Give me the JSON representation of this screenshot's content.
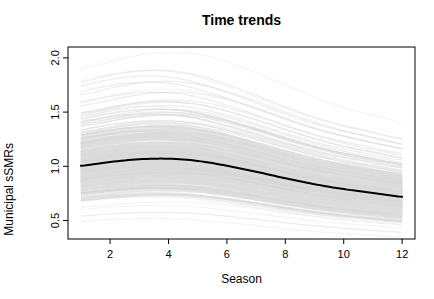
{
  "chart_data": {
    "type": "line",
    "title": "Time trends",
    "xlabel": "Season",
    "ylabel": "Municipal sSMRs",
    "x_tick_values": [
      2,
      4,
      6,
      8,
      10,
      12
    ],
    "x_tick_labels": [
      "2",
      "4",
      "6",
      "8",
      "10",
      "12"
    ],
    "y_tick_values": [
      0.5,
      1.0,
      1.5,
      2.0
    ],
    "y_tick_labels": [
      "0.5",
      "1.0",
      "1.5",
      "2.0"
    ],
    "xlim": [
      0.56,
      12.44
    ],
    "ylim": [
      0.33,
      2.1
    ],
    "grid": false,
    "legend": false,
    "seasons": [
      1,
      2,
      3,
      4,
      5,
      6,
      7,
      8,
      9,
      10,
      11,
      12
    ],
    "mean_series": {
      "name": "mean-trend",
      "color": "#000000",
      "line_width": 2,
      "values": [
        1.005,
        1.04,
        1.065,
        1.07,
        1.05,
        1.005,
        0.95,
        0.89,
        0.835,
        0.79,
        0.755,
        0.72
      ]
    },
    "spaghetti": {
      "name": "municipal-curves",
      "description": "Many light-gray municipal sSMR seasonal curves spread multiplicatively around the mean trend; dense band roughly 0.85-1.42 at the season 3-4 peak, extreme curves reaching about 2.09 high and 0.48 low",
      "n_curves": 420,
      "scale_sigma": 0.17,
      "outlier_scales": [
        1.92,
        1.78,
        1.66,
        1.58,
        1.5,
        1.44,
        0.52,
        0.48
      ],
      "phase_jitter": 0.9,
      "value_jitter": 0.015,
      "seed": 7,
      "color": "#dcdcdc",
      "alpha": 0.55,
      "accent_color": "#c6c6c6",
      "accent_alpha": 0.2,
      "line_width": 1.2,
      "band_peak_range": [
        0.85,
        1.42
      ],
      "band_extent_range": [
        0.48,
        2.09
      ]
    }
  },
  "frame": {
    "background": "#ffffff",
    "box_color": "#000000"
  }
}
